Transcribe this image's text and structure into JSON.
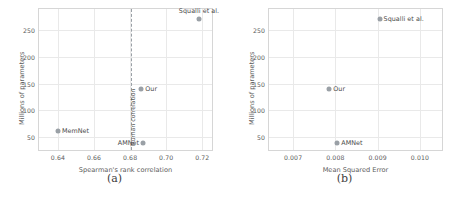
{
  "figure": {
    "panels": [
      {
        "subcaption": "(a)",
        "chart_data": {
          "type": "scatter",
          "title": "",
          "xlabel": "Spearman's rank correlation",
          "ylabel": "Millions of parameters",
          "xlim": [
            0.6295,
            0.7265
          ],
          "ylim": [
            290,
            22
          ],
          "y_inverted": true,
          "grid": true,
          "legend": "none",
          "xticks": [
            "0.64",
            "0.66",
            "0.68",
            "0.70",
            "0.72"
          ],
          "xtick_values": [
            0.64,
            0.66,
            0.68,
            0.7,
            0.72
          ],
          "yticks": [
            "50",
            "100",
            "150",
            "200",
            "250"
          ],
          "ytick_values": [
            50,
            100,
            150,
            200,
            250
          ],
          "points": [
            {
              "label": "MemNet",
              "x": 0.64,
              "y": 62,
              "label_pos": "right",
              "color": "#9aa0a6"
            },
            {
              "label": "AMNet",
              "x": 0.6872,
              "y": 39,
              "label_pos": "left",
              "color": "#9aa0a6"
            },
            {
              "label": "Our",
              "x": 0.6862,
              "y": 140,
              "label_pos": "right",
              "color": "#9aa0a6"
            },
            {
              "label": "Squalli et al.",
              "x": 0.7182,
              "y": 272,
              "label_pos": "above",
              "color": "#9aa0a6"
            }
          ],
          "annotations": [
            {
              "type": "vline",
              "x": 0.6805,
              "label": "Human correlation",
              "style": "dashed",
              "color": "#9aa0a6"
            }
          ]
        }
      },
      {
        "subcaption": "(b)",
        "chart_data": {
          "type": "scatter",
          "title": "",
          "xlabel": "Mean Squared Error",
          "ylabel": "Millions of parameters",
          "xlim": [
            0.00643,
            0.01057
          ],
          "ylim": [
            290,
            22
          ],
          "y_inverted": true,
          "grid": true,
          "legend": "none",
          "xticks": [
            "0.007",
            "0.008",
            "0.009",
            "0.010"
          ],
          "xtick_values": [
            0.007,
            0.008,
            0.009,
            0.01
          ],
          "yticks": [
            "50",
            "100",
            "150",
            "200",
            "250"
          ],
          "ytick_values": [
            50,
            100,
            150,
            200,
            250
          ],
          "points": [
            {
              "label": "AMNet",
              "x": 0.008045,
              "y": 39,
              "label_pos": "right",
              "color": "#9aa0a6"
            },
            {
              "label": "Our",
              "x": 0.007855,
              "y": 140,
              "label_pos": "right",
              "color": "#9aa0a6"
            },
            {
              "label": "Squalli et al.",
              "x": 0.009045,
              "y": 272,
              "label_pos": "right",
              "color": "#9aa0a6"
            }
          ],
          "annotations": []
        }
      }
    ]
  }
}
